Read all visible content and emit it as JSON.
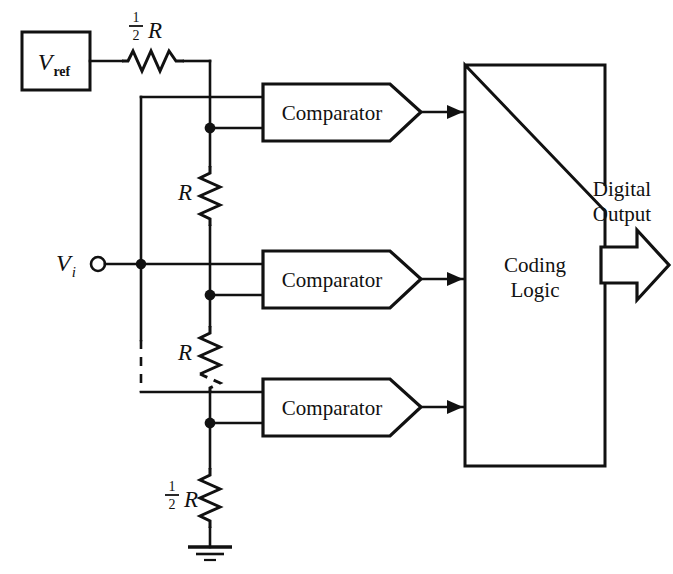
{
  "figure": {
    "ink_color": "#111111",
    "background_color": "#ffffff"
  },
  "sources": {
    "vref_label_main": "V",
    "vref_label_sub": "ref",
    "vi_label_main": "V",
    "vi_label_sub": "i"
  },
  "resistors": [
    {
      "id": "r-top-half",
      "numerator": "1",
      "denominator": "2",
      "symbol": "R",
      "orientation": "horizontal"
    },
    {
      "id": "r-ladder-1",
      "numerator": "",
      "denominator": "",
      "symbol": "R",
      "orientation": "vertical"
    },
    {
      "id": "r-ladder-2",
      "numerator": "",
      "denominator": "",
      "symbol": "R",
      "orientation": "vertical"
    },
    {
      "id": "r-bottom-half",
      "numerator": "1",
      "denominator": "2",
      "symbol": "R",
      "orientation": "vertical"
    }
  ],
  "comparators": [
    {
      "id": "comparator-1",
      "label": "Comparator"
    },
    {
      "id": "comparator-2",
      "label": "Comparator"
    },
    {
      "id": "comparator-3",
      "label": "Comparator"
    }
  ],
  "coding_logic": {
    "label_line1": "Coding",
    "label_line2": "Logic"
  },
  "output": {
    "label_line1": "Digital",
    "label_line2": "Output"
  },
  "ground": {
    "name": "ground-symbol"
  }
}
